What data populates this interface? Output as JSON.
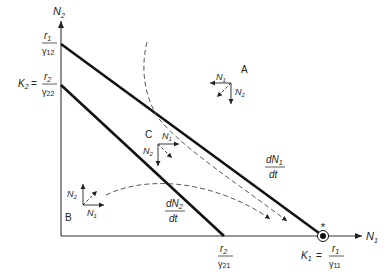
{
  "diagram": {
    "axes": {
      "y_label": "N",
      "y_sub": "2",
      "x_label": "N",
      "x_sub": "1"
    },
    "y_intercepts": {
      "upper": {
        "num": "r",
        "num_sub": "1",
        "den": "γ",
        "den_sub": "12"
      },
      "lower": {
        "prefix": "K",
        "prefix_sub": "2",
        "eq": "=",
        "num": "r",
        "num_sub": "2",
        "den": "γ",
        "den_sub": "22"
      }
    },
    "x_intercepts": {
      "lower": {
        "num": "r",
        "num_sub": "2",
        "den": "γ",
        "den_sub": "21"
      },
      "upper": {
        "prefix": "K",
        "prefix_sub": "1",
        "eq": "=",
        "num": "r",
        "num_sub": "1",
        "den": "γ",
        "den_sub": "11"
      }
    },
    "isoclines": {
      "n1": {
        "num": "dN",
        "num_sub": "1",
        "den": "dt"
      },
      "n2": {
        "num": "dN",
        "num_sub": "2",
        "den": "dt"
      }
    },
    "regions": {
      "a": {
        "label": "A",
        "n1": "N",
        "n1_sub": "1",
        "n2": "N",
        "n2_sub": "2"
      },
      "b": {
        "label": "B",
        "n1": "N",
        "n1_sub": "1",
        "n2": "N",
        "n2_sub": "2"
      },
      "c": {
        "label": "C",
        "n1": "N",
        "n1_sub": "1",
        "n2": "N",
        "n2_sub": "2"
      }
    },
    "equilibrium": {
      "marker": "*"
    }
  }
}
